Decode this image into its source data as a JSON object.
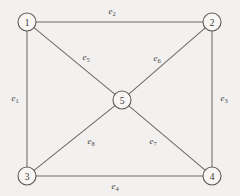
{
  "figure": {
    "type": "undirected-graph",
    "background_color": "#f2f1ef",
    "line_color": "#6e6c6a",
    "node_fill_color": "#f7f6f4",
    "node_stroke_color": "#5d5b59",
    "label_color": "#46443f"
  },
  "nodes": [
    {
      "id": "1",
      "label": "1",
      "x": 27,
      "y": 22,
      "r": 9
    },
    {
      "id": "2",
      "label": "2",
      "x": 212,
      "y": 22,
      "r": 9
    },
    {
      "id": "3",
      "label": "3",
      "x": 27,
      "y": 176,
      "r": 9
    },
    {
      "id": "4",
      "label": "4",
      "x": 212,
      "y": 176,
      "r": 9
    },
    {
      "id": "5",
      "label": "5",
      "x": 122,
      "y": 100,
      "r": 9
    }
  ],
  "edges": [
    {
      "id": "e1",
      "letter": "e",
      "subscript": "1",
      "from": "1",
      "to": "3",
      "label_x": 15,
      "label_y": 98
    },
    {
      "id": "e2",
      "letter": "e",
      "subscript": "2",
      "from": "1",
      "to": "2",
      "label_x": 112,
      "label_y": 11
    },
    {
      "id": "e3",
      "letter": "e",
      "subscript": "3",
      "from": "2",
      "to": "4",
      "label_x": 224,
      "label_y": 98
    },
    {
      "id": "e4",
      "letter": "e",
      "subscript": "4",
      "from": "3",
      "to": "4",
      "label_x": 115,
      "label_y": 186
    },
    {
      "id": "e5",
      "letter": "e",
      "subscript": "5",
      "from": "1",
      "to": "5",
      "label_x": 86,
      "label_y": 57
    },
    {
      "id": "e6",
      "letter": "e",
      "subscript": "6",
      "from": "2",
      "to": "5",
      "label_x": 157,
      "label_y": 58
    },
    {
      "id": "e7",
      "letter": "e",
      "subscript": "7",
      "from": "5",
      "to": "4",
      "label_x": 153,
      "label_y": 141
    },
    {
      "id": "e8",
      "letter": "e",
      "subscript": "8",
      "from": "3",
      "to": "5",
      "label_x": 91,
      "label_y": 141
    }
  ]
}
